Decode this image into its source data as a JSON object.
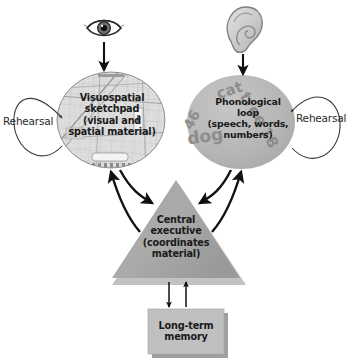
{
  "diagram": {
    "background_color": "#ffffff",
    "nodes": {
      "visuospatial_sketchpad": {
        "label": "Visuospatial\nsketchpad\n(visual and\nspatial material)",
        "shape": "circle",
        "fill": "#d8d8d8"
      },
      "phonological_loop": {
        "label": "Phonological\nloop\n(speech, words,\nnumbers)",
        "shape": "circle",
        "fill": "#b9b9b9"
      },
      "central_executive": {
        "label": "Central\nexecutive\n(coordinates\nmaterial)",
        "shape": "triangle",
        "fill": "#a8a8a8"
      },
      "long_term_memory": {
        "label": "Long-term\nmemory",
        "shape": "rectangle",
        "fill": "#bdbdbd"
      }
    },
    "inputs": {
      "visual_input_icon": "eye-icon",
      "auditory_input_icon": "ear-icon"
    },
    "loops": {
      "left_rehearsal_label": "Rehearsal",
      "right_rehearsal_label": "Rehearsal"
    },
    "phonological_items": [
      {
        "text": "cat",
        "x": 231,
        "y": 95,
        "size": 15,
        "rotate": -18
      },
      {
        "text": "46",
        "x": 196,
        "y": 122,
        "size": 14,
        "rotate": -62
      },
      {
        "text": "tree",
        "x": 249,
        "y": 112,
        "size": 16,
        "rotate": 58
      },
      {
        "text": "dog",
        "x": 206,
        "y": 142,
        "size": 17,
        "rotate": -8
      },
      {
        "text": "18",
        "x": 265,
        "y": 140,
        "size": 15,
        "rotate": 62
      }
    ]
  }
}
